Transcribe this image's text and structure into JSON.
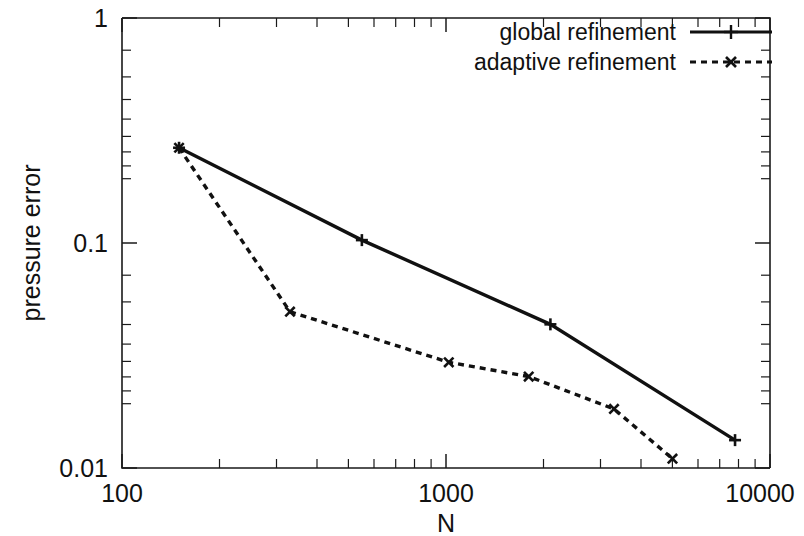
{
  "chart_data": {
    "type": "line",
    "title": "",
    "xlabel": "N",
    "ylabel": "pressure error",
    "xscale": "log",
    "yscale": "log",
    "xlim": [
      100,
      10000
    ],
    "ylim": [
      0.01,
      1
    ],
    "grid": false,
    "legend_position": "top-right",
    "xticks": [
      100,
      1000,
      10000
    ],
    "xtick_labels": [
      "100",
      "1000",
      "10000"
    ],
    "yticks": [
      0.01,
      0.1,
      1
    ],
    "ytick_labels": [
      "0.01",
      "0.1",
      "1"
    ],
    "series": [
      {
        "name": "global refinement",
        "linestyle": "solid",
        "marker": "plus",
        "color": "#111111",
        "x": [
          150,
          550,
          2100,
          7800
        ],
        "values": [
          0.265,
          0.103,
          0.0435,
          0.0133
        ]
      },
      {
        "name": "adaptive refinement",
        "linestyle": "dashed",
        "marker": "cross",
        "color": "#111111",
        "x": [
          150,
          330,
          1020,
          1800,
          3300,
          5000
        ],
        "values": [
          0.265,
          0.0495,
          0.0295,
          0.0255,
          0.0183,
          0.011
        ]
      }
    ]
  },
  "axes": {
    "y_label": "pressure error",
    "x_label": "N",
    "y_tick_top": "1",
    "y_tick_mid": "0.1",
    "y_tick_bottom": "0.01",
    "x_tick_left": "100",
    "x_tick_mid": "1000",
    "x_tick_right": "10000"
  },
  "legend": {
    "entries": [
      {
        "label": "global refinement"
      },
      {
        "label": "adaptive refinement"
      }
    ]
  }
}
